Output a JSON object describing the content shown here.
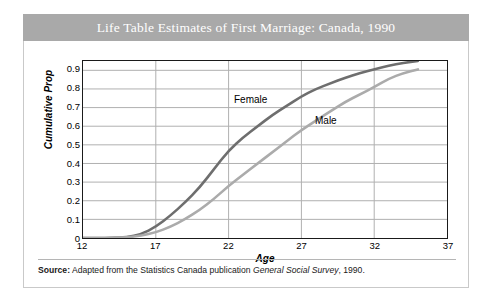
{
  "figure": {
    "title": "Life Table Estimates of First Marriage: Canada, 1990",
    "title_band_color": "#a9a9a9",
    "title_text_color": "#ffffff",
    "source_prefix": "Source:",
    "source_text_before": " Adapted from the Statistics Canada publication ",
    "source_publication": "General Social Survey",
    "source_text_after": ", 1990."
  },
  "chart_data": {
    "type": "line",
    "title": "Life Table Estimates of First Marriage: Canada, 1990",
    "xlabel": "Age",
    "ylabel": "Cumulative Prop",
    "xlim": [
      12,
      37
    ],
    "ylim": [
      0,
      0.95
    ],
    "xticks": [
      12,
      17,
      22,
      27,
      32,
      37
    ],
    "yticks": [
      0,
      0.1,
      0.2,
      0.3,
      0.4,
      0.5,
      0.6,
      0.7,
      0.8,
      0.9
    ],
    "ytick_labels": [
      "0",
      "0.1",
      "0.2",
      "0.3",
      "0.4",
      "0.5",
      "0.6",
      "0.7",
      "0.8",
      "0.9"
    ],
    "xtick_labels": [
      "12",
      "17",
      "22",
      "27",
      "32",
      "37"
    ],
    "grid": "horizontal",
    "legend": "inline-annotations",
    "x": [
      12,
      13,
      14,
      15,
      16,
      17,
      18,
      19,
      20,
      21,
      22,
      23,
      24,
      25,
      26,
      27,
      28,
      29,
      30,
      31,
      32,
      33,
      34,
      35
    ],
    "series": [
      {
        "name": "Female",
        "color": "#6e6e6e",
        "label_position": {
          "x": 21.5,
          "y": 0.79
        },
        "values": [
          0,
          0,
          0,
          0.005,
          0.02,
          0.06,
          0.12,
          0.19,
          0.27,
          0.37,
          0.47,
          0.54,
          0.6,
          0.66,
          0.71,
          0.76,
          0.8,
          0.83,
          0.86,
          0.885,
          0.905,
          0.925,
          0.94,
          0.95
        ]
      },
      {
        "name": "Male",
        "color": "#ababab",
        "label_position": {
          "x": 27.2,
          "y": 0.69
        },
        "values": [
          0,
          0,
          0,
          0.004,
          0.012,
          0.03,
          0.06,
          0.1,
          0.15,
          0.21,
          0.28,
          0.34,
          0.4,
          0.46,
          0.52,
          0.58,
          0.63,
          0.68,
          0.73,
          0.77,
          0.81,
          0.855,
          0.885,
          0.905
        ]
      }
    ]
  }
}
